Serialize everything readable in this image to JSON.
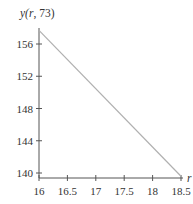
{
  "chart_data": {
    "type": "line",
    "title": "",
    "xlabel": "r",
    "ylabel": "y(r, 73)",
    "xlim": [
      16,
      18.5
    ],
    "ylim": [
      139.5,
      158
    ],
    "x_ticks": [
      16,
      16.5,
      17,
      17.5,
      18,
      18.5
    ],
    "x_tick_labels": [
      "16",
      "16.5",
      "17",
      "17.5",
      "18",
      "18.5"
    ],
    "y_ticks": [
      140,
      144,
      148,
      152,
      156
    ],
    "y_tick_labels": [
      "140",
      "144",
      "148",
      "152",
      "156"
    ],
    "grid": false,
    "legend": null,
    "series": [
      {
        "name": "y(r, 73)",
        "x": [
          16,
          18.5
        ],
        "values": [
          157.7,
          139.6
        ],
        "color": "#b0b0b0"
      }
    ]
  },
  "labels": {
    "y_title_prefix": "y(",
    "y_title_var": "r",
    "y_title_suffix": ", 73)",
    "x_title": "r"
  },
  "colors": {
    "axis": "#555555",
    "line": "#b0b0b0",
    "text": "#333333"
  }
}
